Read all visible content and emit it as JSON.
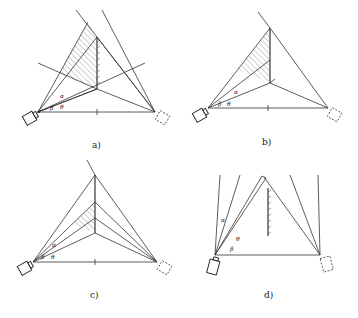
{
  "figure": {
    "panels": [
      {
        "id": "a",
        "caption": "a)",
        "angle_labels": [
          "α",
          "β",
          "θ"
        ],
        "shaded_region": "large",
        "has_extended_lines": true
      },
      {
        "id": "b",
        "caption": "b)",
        "angle_labels": [
          "α",
          "β",
          "θ"
        ],
        "shaded_region": "medium",
        "has_extended_lines": false
      },
      {
        "id": "c",
        "caption": "c)",
        "angle_labels": [
          "α",
          "β",
          "θ"
        ],
        "shaded_region": "small",
        "has_extended_lines": false
      },
      {
        "id": "d",
        "caption": "d)",
        "angle_labels": [
          "α",
          "β",
          "θ"
        ],
        "shaded_region": "none",
        "has_extended_lines": false
      }
    ],
    "colors": {
      "line": "#333333",
      "background": "#ffffff"
    }
  }
}
